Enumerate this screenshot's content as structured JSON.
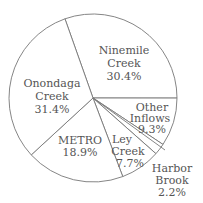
{
  "chart_data": {
    "type": "pie",
    "title": "",
    "categories": [
      "Ninemile Creek",
      "Other Inflows",
      "Harbor Brook",
      "Ley Creek",
      "METRO",
      "Onondaga Creek"
    ],
    "values": [
      30.4,
      9.3,
      2.2,
      7.7,
      18.9,
      31.4
    ],
    "unit": "%",
    "labels": [
      {
        "name_line1": "Ninemile",
        "name_line2": "Creek",
        "pct": "30.4%"
      },
      {
        "name_line1": "Other",
        "name_line2": "Inflows",
        "pct": "9.3%"
      },
      {
        "name_line1": "Harbor",
        "name_line2": "Brook",
        "pct": "2.2%"
      },
      {
        "name_line1": "Ley",
        "name_line2": "Creek",
        "pct": "7.7%"
      },
      {
        "name_line1": "METRO",
        "name_line2": "",
        "pct": "18.9%"
      },
      {
        "name_line1": "Onondaga",
        "name_line2": "Creek",
        "pct": "31.4%"
      }
    ],
    "start_angle_deg": -109.5,
    "direction": "clockwise",
    "legend": "none",
    "colors": {
      "fill": "#ffffff",
      "stroke": "#777777",
      "text": "#555555"
    }
  }
}
